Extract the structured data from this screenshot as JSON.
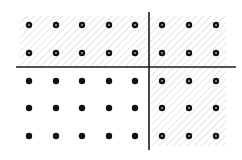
{
  "diagram": {
    "width": 242,
    "height": 160,
    "title": "",
    "grid": {
      "columns_x": [
        29,
        56,
        82,
        109,
        135,
        162,
        189,
        216
      ],
      "rows_y": [
        25,
        53,
        81,
        108,
        136
      ],
      "dot_radius": 3.2
    },
    "lines": {
      "horizontal": {
        "y": 67,
        "x1": 16,
        "x2": 236
      },
      "vertical": {
        "x": 149,
        "y1": 12,
        "y2": 150
      }
    },
    "shaded_regions": [
      {
        "name": "top-band",
        "x": 20,
        "y": 16,
        "w": 206,
        "h": 50
      },
      {
        "name": "right-band",
        "x": 151,
        "y": 67,
        "w": 75,
        "h": 79
      }
    ],
    "colors": {
      "line": "#1a1a1a",
      "dot": "#111111",
      "hatch": "#cfcfcf",
      "background": "#ffffff"
    },
    "legend": "Dots inside shaded regions are drawn as rings; dots outside are solid."
  }
}
